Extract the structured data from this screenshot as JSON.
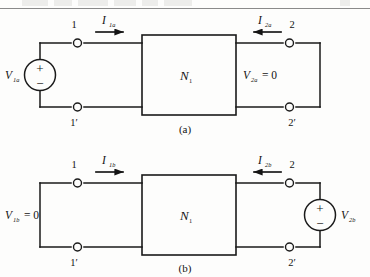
{
  "figure": {
    "type": "two-port-network-circuit-diagram",
    "background_color": "#fdfdfc",
    "line_color": "#1a1a1a",
    "subfigures": [
      {
        "caption": "(a)",
        "network_block_label": "N",
        "network_block_subscript": "1",
        "source": {
          "position": "left",
          "type": "independent-voltage-source",
          "label": "V",
          "label_subscript": "1a",
          "plus_sign": "+",
          "minus_sign": "−"
        },
        "terminals": [
          {
            "name": "1",
            "position": "top-left"
          },
          {
            "name": "1′",
            "position": "bottom-left"
          },
          {
            "name": "2",
            "position": "top-right"
          },
          {
            "name": "2′",
            "position": "bottom-right"
          }
        ],
        "currents": [
          {
            "label": "I",
            "subscript": "1a",
            "direction": "right",
            "side": "left-port"
          },
          {
            "label": "I",
            "subscript": "2a",
            "direction": "left",
            "side": "right-port"
          }
        ],
        "port_condition": {
          "label": "V",
          "subscript": "2a",
          "relation": "= 0",
          "side": "right-port",
          "meaning": "output-shorted"
        }
      },
      {
        "caption": "(b)",
        "network_block_label": "N",
        "network_block_subscript": "1",
        "source": {
          "position": "right",
          "type": "independent-voltage-source",
          "label": "V",
          "label_subscript": "2b",
          "plus_sign": "+",
          "minus_sign": "−"
        },
        "terminals": [
          {
            "name": "1",
            "position": "top-left"
          },
          {
            "name": "1′",
            "position": "bottom-left"
          },
          {
            "name": "2",
            "position": "top-right"
          },
          {
            "name": "2′",
            "position": "bottom-right"
          }
        ],
        "currents": [
          {
            "label": "I",
            "subscript": "1b",
            "direction": "right",
            "side": "left-port"
          },
          {
            "label": "I",
            "subscript": "2b",
            "direction": "left",
            "side": "right-port"
          }
        ],
        "port_condition": {
          "label": "V",
          "subscript": "1b",
          "relation": "= 0",
          "side": "left-port",
          "meaning": "input-shorted"
        }
      }
    ]
  }
}
